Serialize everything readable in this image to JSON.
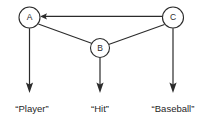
{
  "diagram": {
    "type": "directed-graph",
    "nodes": [
      {
        "id": "A",
        "label": "A",
        "cx": 29.5,
        "cy": 17.5,
        "r": 10.5
      },
      {
        "id": "B",
        "label": "B",
        "cx": 100.0,
        "cy": 48.0,
        "r": 9.5
      },
      {
        "id": "C",
        "label": "C",
        "cx": 173.0,
        "cy": 17.5,
        "r": 10.5
      }
    ],
    "edges": [
      {
        "id": "C-to-A",
        "from": "C",
        "to": "A",
        "arrow": "to-A",
        "style": "solid"
      },
      {
        "id": "A-to-B",
        "from": "A",
        "to": "B",
        "arrow": "none",
        "style": "solid"
      },
      {
        "id": "B-to-C",
        "from": "B",
        "to": "C",
        "arrow": "none",
        "style": "solid"
      }
    ],
    "terminal_arrows": [
      {
        "id": "A-down",
        "from": "A",
        "x": 29.5,
        "y_start": 28,
        "y_end": 92
      },
      {
        "id": "B-down",
        "from": "B",
        "x": 100.0,
        "y_start": 57.5,
        "y_end": 92
      },
      {
        "id": "C-down",
        "from": "C",
        "x": 173.0,
        "y_start": 28,
        "y_end": 92
      }
    ],
    "terminal_labels": [
      {
        "id": "label-player",
        "text": "“Player”",
        "x": 32,
        "y": 112
      },
      {
        "id": "label-hit",
        "text": "“Hit”",
        "x": 100,
        "y": 112
      },
      {
        "id": "label-baseball",
        "text": "“Baseball”",
        "x": 173,
        "y": 112
      }
    ],
    "colors": {
      "stroke": "#2b2b2b",
      "text": "#1f1f1f",
      "node_fill": "#ffffff",
      "background": "#ffffff"
    }
  }
}
